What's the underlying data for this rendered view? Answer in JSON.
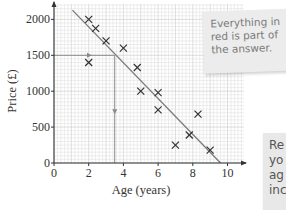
{
  "chart_data": {
    "type": "scatter",
    "title": "",
    "xlabel": "Age (years)",
    "ylabel": "Price (£)",
    "xlim": [
      0,
      11
    ],
    "ylim": [
      0,
      2200
    ],
    "x_ticks": [
      0,
      2,
      4,
      6,
      8,
      10
    ],
    "y_ticks": [
      0,
      500,
      1000,
      1500,
      2000
    ],
    "grid": true,
    "series": [
      {
        "name": "data points",
        "marker": "x",
        "points": [
          {
            "x": 2,
            "y": 2000
          },
          {
            "x": 2.4,
            "y": 1875
          },
          {
            "x": 3,
            "y": 1700
          },
          {
            "x": 4,
            "y": 1600
          },
          {
            "x": 2,
            "y": 1400
          },
          {
            "x": 4.8,
            "y": 1330
          },
          {
            "x": 5,
            "y": 1000
          },
          {
            "x": 6,
            "y": 980
          },
          {
            "x": 6,
            "y": 740
          },
          {
            "x": 8.3,
            "y": 680
          },
          {
            "x": 7.8,
            "y": 390
          },
          {
            "x": 7,
            "y": 250
          },
          {
            "x": 9,
            "y": 180
          }
        ]
      }
    ],
    "line_of_best_fit": {
      "x1": 0.6,
      "y1": 2230,
      "x2": 9.6,
      "y2": 0
    },
    "reading_lines": {
      "from_y": 1500,
      "to_x": 3.5
    },
    "colors": {
      "axis": "#333333",
      "grid_minor": "#dcdcdc",
      "grid_major": "#bdbdbd",
      "fit_line": "#7a7a7a",
      "marker": "#333333",
      "reading_line": "#8a8a8a"
    }
  },
  "notes": {
    "top": [
      "Everything in",
      "red is part of",
      "the answer."
    ],
    "bottom": [
      "Re",
      "yo",
      "ag",
      "inc"
    ]
  }
}
